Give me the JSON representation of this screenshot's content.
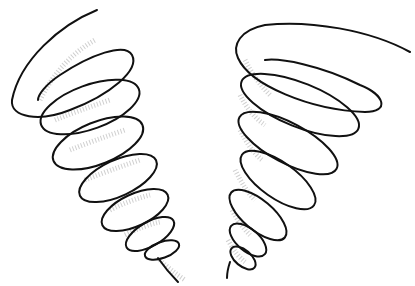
{
  "image": {
    "description": "Two hand-drawn tornado spiral illustrations, black ink on white with stippled shading",
    "colors": {
      "background": "#ffffff",
      "ink": "#111111",
      "shading": "#bbbbbb"
    }
  }
}
